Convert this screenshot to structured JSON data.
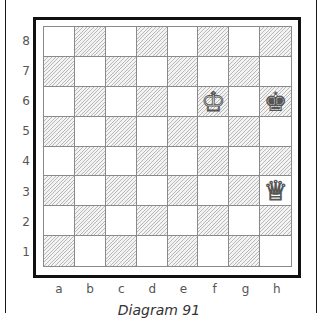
{
  "diagram": {
    "caption": "Diagram 91",
    "files": [
      "a",
      "b",
      "c",
      "d",
      "e",
      "f",
      "g",
      "h"
    ],
    "ranks": [
      "8",
      "7",
      "6",
      "5",
      "4",
      "3",
      "2",
      "1"
    ],
    "pieces": [
      {
        "square": "f6",
        "type": "king",
        "color": "white",
        "glyph": "♔"
      },
      {
        "square": "h6",
        "type": "king",
        "color": "black",
        "glyph": "♚"
      },
      {
        "square": "h3",
        "type": "queen",
        "color": "white",
        "glyph": "♕"
      }
    ],
    "colors": {
      "frame": "#111111",
      "grid": "#8a8a8a",
      "hatch": "#b9b9b9",
      "light_square": "#ffffff"
    }
  }
}
